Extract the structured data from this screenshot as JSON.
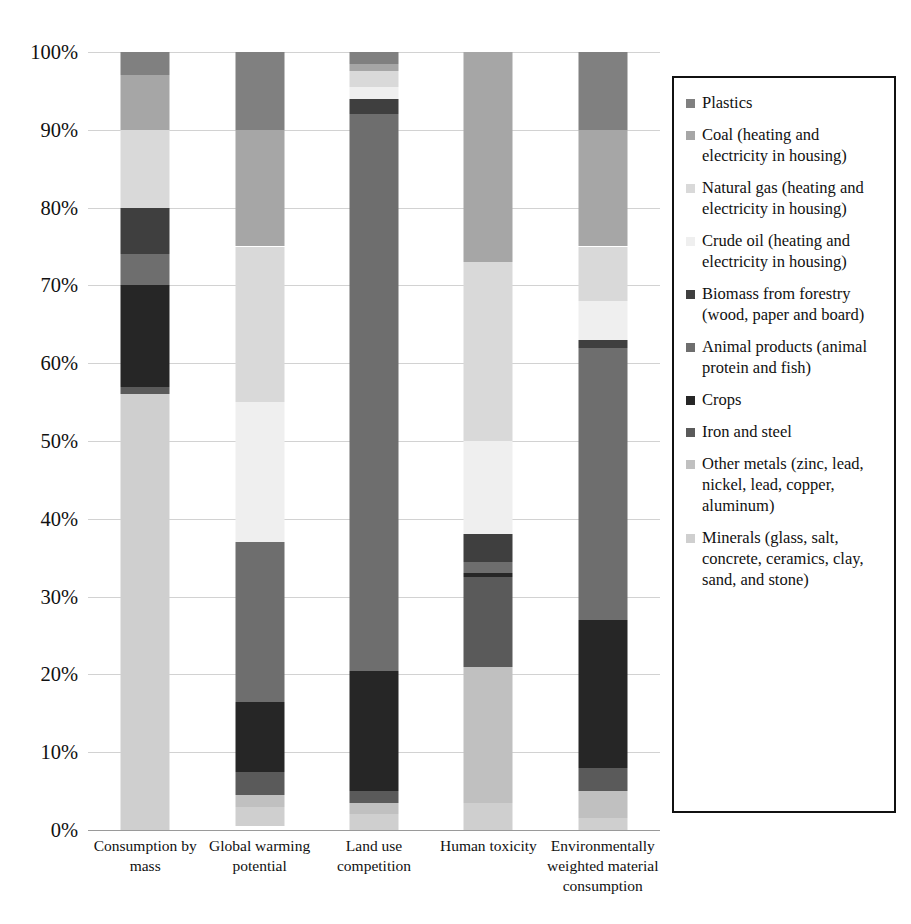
{
  "chart_data": {
    "type": "bar",
    "subtype": "stacked-percentage-column",
    "title": "",
    "xlabel": "",
    "ylabel": "",
    "ylim": [
      0,
      100
    ],
    "ytick_labels": [
      "100%",
      "90%",
      "80%",
      "70%",
      "60%",
      "50%",
      "40%",
      "30%",
      "20%",
      "10%",
      "0%"
    ],
    "ytick_values": [
      100,
      90,
      80,
      70,
      60,
      50,
      40,
      30,
      20,
      10,
      0
    ],
    "grid": true,
    "legend_position": "right",
    "units": "percent",
    "categories": [
      "Consumption by mass",
      "Global warming potential",
      "Land use competition",
      "Human toxicity",
      "Environmentally weighted material consumption"
    ],
    "series": [
      {
        "name": "Plastics",
        "color": "#808080",
        "values": [
          3.0,
          10.0,
          1.5,
          0.0,
          10.0
        ]
      },
      {
        "name": "Coal (heating and electricity in housing)",
        "color": "#a6a6a6",
        "values": [
          7.0,
          15.0,
          1.0,
          27.0,
          15.0
        ]
      },
      {
        "name": "Natural gas (heating and electricity in housing)",
        "color": "#d9d9d9",
        "values": [
          10.0,
          20.0,
          2.0,
          23.0,
          7.0
        ]
      },
      {
        "name": "Crude oil (heating and electricity in housing)",
        "color": "#efefef",
        "values": [
          0.0,
          18.0,
          1.5,
          12.0,
          5.0
        ]
      },
      {
        "name": "Biomass from forestry (wood, paper and board)",
        "color": "#3f3f3f",
        "values": [
          6.0,
          0.0,
          2.0,
          3.5,
          1.0
        ]
      },
      {
        "name": "Animal products (animal protein and fish)",
        "color": "#6e6e6e",
        "values": [
          4.0,
          20.5,
          71.5,
          1.5,
          35.0
        ]
      },
      {
        "name": "Crops",
        "color": "#262626",
        "values": [
          13.0,
          9.0,
          15.5,
          0.5,
          19.0
        ]
      },
      {
        "name": "Iron and steel",
        "color": "#5a5a5a",
        "values": [
          1.0,
          3.0,
          1.5,
          11.5,
          3.0
        ]
      },
      {
        "name": "Other metals (zinc, lead, nickel, lead, copper, aluminum)",
        "color": "#c0c0c0",
        "values": [
          0.0,
          1.5,
          1.5,
          17.5,
          3.5
        ]
      },
      {
        "name": "Minerals (glass, salt, concrete, ceramics, clay, sand, and stone)",
        "color": "#cfcfcf",
        "values": [
          56.0,
          2.5,
          2.0,
          3.5,
          1.5
        ]
      }
    ]
  },
  "legend": {
    "items": [
      {
        "label": "Plastics",
        "color": "#808080"
      },
      {
        "label": "Coal (heating and electricity in housing)",
        "color": "#a6a6a6"
      },
      {
        "label": "Natural gas (heating and electricity in housing)",
        "color": "#d9d9d9"
      },
      {
        "label": "Crude oil (heating and electricity in housing)",
        "color": "#efefef"
      },
      {
        "label": "Biomass from forestry (wood, paper and board)",
        "color": "#3f3f3f"
      },
      {
        "label": "Animal products (animal protein and fish)",
        "color": "#6e6e6e"
      },
      {
        "label": "Crops",
        "color": "#262626"
      },
      {
        "label": "Iron and steel",
        "color": "#5a5a5a"
      },
      {
        "label": "Other metals (zinc, lead, nickel, lead, copper, aluminum)",
        "color": "#c0c0c0"
      },
      {
        "label": "Minerals (glass, salt, concrete, ceramics, clay, sand, and stone)",
        "color": "#cfcfcf"
      }
    ]
  }
}
